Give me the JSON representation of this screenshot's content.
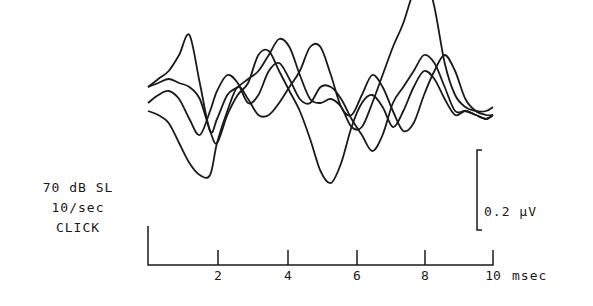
{
  "conditions": {
    "level": "70 dB SL",
    "rate": "10/sec",
    "stimulus": "CLICK"
  },
  "scale_bar": {
    "label": "0.2 µV",
    "value_uV": 0.2
  },
  "x_axis": {
    "unit_label": "msec",
    "ticks": [
      "2",
      "4",
      "6",
      "8",
      "10"
    ]
  },
  "chart_data": {
    "type": "line",
    "title": "",
    "xlabel": "msec",
    "ylabel": "µV (scale bar 0.2 µV)",
    "xlim": [
      0,
      10
    ],
    "x_ticks": [
      2,
      4,
      6,
      8,
      10
    ],
    "annotations": [
      "70 dB SL",
      "10/sec",
      "CLICK",
      "0.2 µV"
    ],
    "grid": false,
    "legend": null,
    "series": [
      {
        "name": "trace-1",
        "x": [
          0,
          0.3,
          0.6,
          0.9,
          1.2,
          1.5,
          1.8,
          2.0,
          2.3,
          2.6,
          2.9,
          3.2,
          3.5,
          3.8,
          4.1,
          4.4,
          4.7,
          5.0,
          5.3,
          5.6,
          5.9,
          6.2,
          6.5,
          6.8,
          7.1,
          7.4,
          7.7,
          8.0,
          8.3,
          8.6,
          8.9,
          9.2,
          9.5,
          9.8,
          10.0
        ],
        "y": [
          0.02,
          0.03,
          0.04,
          0.03,
          0.02,
          -0.01,
          -0.09,
          -0.12,
          -0.05,
          0.0,
          0.03,
          0.1,
          0.11,
          0.06,
          0.01,
          -0.04,
          -0.11,
          -0.19,
          -0.22,
          -0.17,
          -0.08,
          -0.02,
          0.0,
          -0.03,
          -0.08,
          -0.04,
          0.02,
          0.06,
          0.04,
          -0.01,
          -0.05,
          -0.04,
          -0.05,
          -0.06,
          -0.05
        ]
      },
      {
        "name": "trace-2",
        "x": [
          0,
          0.3,
          0.6,
          0.9,
          1.2,
          1.5,
          1.8,
          2.0,
          2.3,
          2.6,
          2.9,
          3.2,
          3.5,
          3.8,
          4.1,
          4.4,
          4.7,
          5.0,
          5.3,
          5.6,
          5.9,
          6.2,
          6.5,
          6.8,
          7.1,
          7.4,
          7.7,
          8.0,
          8.3,
          8.6,
          8.9,
          9.2,
          9.5,
          9.8,
          10.0
        ],
        "y": [
          -0.02,
          0.0,
          0.01,
          -0.01,
          -0.06,
          -0.1,
          -0.04,
          0.01,
          0.05,
          0.03,
          -0.02,
          0.0,
          0.06,
          0.08,
          0.04,
          -0.01,
          -0.02,
          0.02,
          0.02,
          -0.01,
          -0.06,
          -0.1,
          -0.14,
          -0.1,
          -0.02,
          0.02,
          0.06,
          0.1,
          0.08,
          0.02,
          -0.04,
          -0.04,
          -0.05,
          -0.06,
          -0.05
        ]
      },
      {
        "name": "trace-3",
        "x": [
          0,
          0.3,
          0.6,
          0.9,
          1.2,
          1.5,
          1.8,
          2.0,
          2.3,
          2.6,
          2.9,
          3.2,
          3.5,
          3.8,
          4.1,
          4.4,
          4.7,
          5.0,
          5.3,
          5.6,
          5.9,
          6.2,
          6.5,
          6.8,
          7.1,
          7.4,
          7.7,
          8.0,
          8.3,
          8.6,
          8.9,
          9.2,
          9.5,
          9.8,
          10.0
        ],
        "y": [
          0.02,
          0.04,
          0.06,
          0.1,
          0.15,
          0.03,
          -0.09,
          -0.06,
          0.0,
          0.02,
          0.04,
          0.06,
          0.1,
          0.14,
          0.12,
          0.05,
          -0.01,
          -0.02,
          -0.01,
          -0.03,
          -0.08,
          -0.08,
          -0.02,
          0.05,
          0.12,
          0.18,
          0.26,
          0.31,
          0.22,
          0.08,
          0.0,
          -0.03,
          -0.04,
          -0.04,
          -0.03
        ]
      },
      {
        "name": "trace-4",
        "x": [
          0,
          0.3,
          0.6,
          0.9,
          1.2,
          1.5,
          1.8,
          2.0,
          2.3,
          2.6,
          2.9,
          3.2,
          3.5,
          3.8,
          4.1,
          4.4,
          4.7,
          5.0,
          5.3,
          5.6,
          5.9,
          6.2,
          6.5,
          6.8,
          7.1,
          7.4,
          7.7,
          8.0,
          8.3,
          8.6,
          8.9,
          9.2,
          9.5,
          9.8,
          10.0
        ],
        "y": [
          -0.04,
          -0.05,
          -0.07,
          -0.12,
          -0.17,
          -0.2,
          -0.2,
          -0.12,
          -0.04,
          0.02,
          -0.01,
          -0.05,
          -0.05,
          -0.02,
          0.02,
          0.06,
          0.12,
          0.12,
          0.05,
          -0.03,
          -0.05,
          0.0,
          0.05,
          0.02,
          -0.04,
          -0.09,
          -0.07,
          0.0,
          0.06,
          0.1,
          0.06,
          -0.01,
          -0.04,
          -0.05,
          -0.05
        ]
      }
    ]
  }
}
